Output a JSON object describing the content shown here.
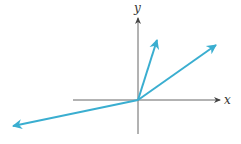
{
  "diagram": {
    "axes": {
      "x_label": "x",
      "y_label": "y",
      "color": "#555555"
    },
    "vector_color": "#3aaed0",
    "origin": [
      138,
      100
    ],
    "vectors": [
      {
        "name": "vector-steep",
        "to": [
          158,
          38
        ]
      },
      {
        "name": "vector-shallow",
        "to": [
          218,
          44
        ]
      },
      {
        "name": "vector-lower-left",
        "to": [
          11,
          126
        ]
      }
    ]
  }
}
